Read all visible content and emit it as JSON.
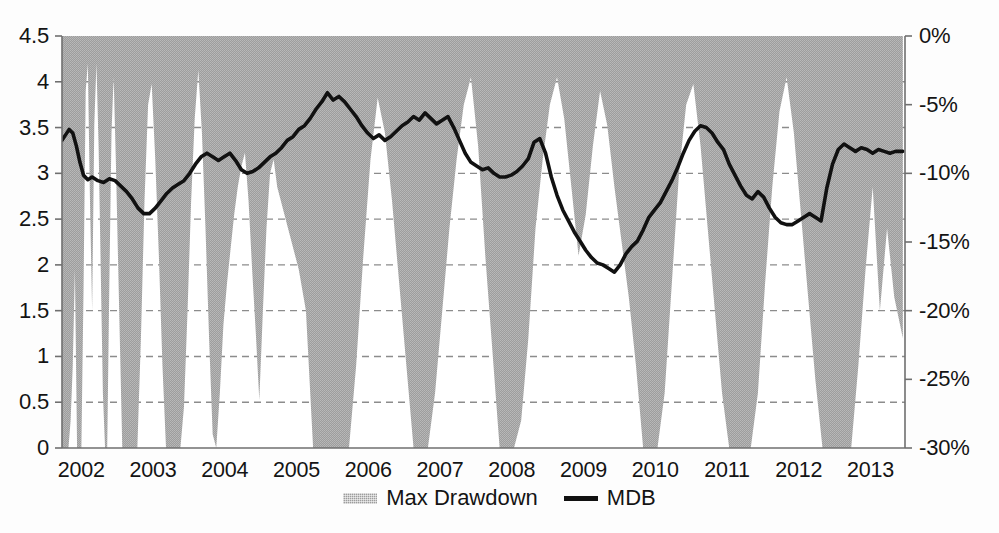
{
  "chart_data": {
    "type": "area",
    "title": "",
    "subtitle": "",
    "xlabel": "",
    "ylabel": "",
    "y2label": "",
    "grid": true,
    "legend_position": "bottom-center",
    "x_range": [
      "2002",
      "2013.75"
    ],
    "x_tick_labels": [
      "2002",
      "2003",
      "2004",
      "2005",
      "2006",
      "2007",
      "2008",
      "2009",
      "2010",
      "2011",
      "2012",
      "2013"
    ],
    "x_tick_values": [
      2002,
      2003,
      2004,
      2005,
      2006,
      2007,
      2008,
      2009,
      2010,
      2011,
      2012,
      2013
    ],
    "y_left_range": [
      0,
      4.5
    ],
    "y_left_tick_labels": [
      "0",
      "0.5",
      "1",
      "1.5",
      "2",
      "2.5",
      "3",
      "3.5",
      "4",
      "4.5"
    ],
    "y_left_tick_values": [
      0,
      0.5,
      1,
      1.5,
      2,
      2.5,
      3,
      3.5,
      4,
      4.5
    ],
    "y_right_range": [
      -30,
      0
    ],
    "y_right_tick_labels": [
      "0%",
      "-5%",
      "-10%",
      "-15%",
      "-20%",
      "-25%",
      "-30%"
    ],
    "y_right_tick_values": [
      0,
      -5,
      -10,
      -15,
      -20,
      -25,
      -30
    ],
    "legend": [
      {
        "name": "Max Drawdown",
        "marker": "area-swatch",
        "color": "#9d9d9d"
      },
      {
        "name": "MDB",
        "marker": "line-swatch",
        "color": "#111111"
      }
    ],
    "series": [
      {
        "name": "MDB",
        "axis": "left",
        "type": "line",
        "color": "#111111",
        "x": [
          2002.0,
          2002.05,
          2002.1,
          2002.15,
          2002.2,
          2002.25,
          2002.3,
          2002.36,
          2002.42,
          2002.5,
          2002.58,
          2002.66,
          2002.74,
          2002.82,
          2002.9,
          2002.98,
          2003.06,
          2003.14,
          2003.22,
          2003.3,
          2003.38,
          2003.46,
          2003.54,
          2003.62,
          2003.7,
          2003.78,
          2003.86,
          2003.94,
          2004.02,
          2004.1,
          2004.18,
          2004.26,
          2004.34,
          2004.42,
          2004.5,
          2004.58,
          2004.66,
          2004.74,
          2004.82,
          2004.9,
          2004.98,
          2005.06,
          2005.14,
          2005.22,
          2005.3,
          2005.38,
          2005.46,
          2005.54,
          2005.62,
          2005.7,
          2005.78,
          2005.86,
          2005.94,
          2006.02,
          2006.1,
          2006.18,
          2006.26,
          2006.34,
          2006.42,
          2006.5,
          2006.58,
          2006.66,
          2006.74,
          2006.82,
          2006.9,
          2006.98,
          2007.06,
          2007.14,
          2007.22,
          2007.3,
          2007.38,
          2007.46,
          2007.54,
          2007.62,
          2007.7,
          2007.78,
          2007.86,
          2007.94,
          2008.02,
          2008.1,
          2008.18,
          2008.26,
          2008.34,
          2008.42,
          2008.5,
          2008.58,
          2008.66,
          2008.74,
          2008.82,
          2008.9,
          2008.98,
          2009.06,
          2009.14,
          2009.22,
          2009.3,
          2009.38,
          2009.46,
          2009.54,
          2009.62,
          2009.7,
          2009.78,
          2009.86,
          2009.94,
          2010.02,
          2010.1,
          2010.18,
          2010.26,
          2010.34,
          2010.42,
          2010.5,
          2010.58,
          2010.66,
          2010.74,
          2010.82,
          2010.9,
          2010.98,
          2011.06,
          2011.14,
          2011.22,
          2011.3,
          2011.38,
          2011.46,
          2011.54,
          2011.62,
          2011.7,
          2011.78,
          2011.86,
          2011.94,
          2012.02,
          2012.1,
          2012.18,
          2012.26,
          2012.34,
          2012.42,
          2012.5,
          2012.58,
          2012.66,
          2012.74,
          2012.82,
          2012.9,
          2012.98,
          2013.06,
          2013.14,
          2013.22,
          2013.3,
          2013.38,
          2013.46,
          2013.54,
          2013.62,
          2013.72
        ],
        "y": [
          3.36,
          3.42,
          3.48,
          3.44,
          3.3,
          3.12,
          2.98,
          2.93,
          2.96,
          2.92,
          2.9,
          2.94,
          2.92,
          2.86,
          2.8,
          2.72,
          2.62,
          2.56,
          2.56,
          2.62,
          2.7,
          2.78,
          2.84,
          2.88,
          2.92,
          3.0,
          3.1,
          3.18,
          3.22,
          3.18,
          3.14,
          3.18,
          3.22,
          3.14,
          3.04,
          3.0,
          3.02,
          3.06,
          3.12,
          3.18,
          3.22,
          3.28,
          3.36,
          3.4,
          3.48,
          3.52,
          3.6,
          3.7,
          3.78,
          3.88,
          3.8,
          3.84,
          3.78,
          3.7,
          3.62,
          3.52,
          3.44,
          3.38,
          3.42,
          3.36,
          3.4,
          3.46,
          3.52,
          3.56,
          3.62,
          3.58,
          3.66,
          3.6,
          3.54,
          3.58,
          3.62,
          3.5,
          3.36,
          3.22,
          3.12,
          3.08,
          3.04,
          3.06,
          3.0,
          2.96,
          2.96,
          2.98,
          3.02,
          3.08,
          3.16,
          3.34,
          3.38,
          3.22,
          2.96,
          2.76,
          2.6,
          2.48,
          2.36,
          2.26,
          2.16,
          2.08,
          2.02,
          2.0,
          1.96,
          1.92,
          2.0,
          2.12,
          2.2,
          2.26,
          2.38,
          2.52,
          2.6,
          2.68,
          2.8,
          2.92,
          3.06,
          3.22,
          3.36,
          3.46,
          3.52,
          3.5,
          3.44,
          3.34,
          3.26,
          3.1,
          2.98,
          2.86,
          2.76,
          2.72,
          2.8,
          2.74,
          2.62,
          2.52,
          2.46,
          2.44,
          2.44,
          2.48,
          2.52,
          2.56,
          2.52,
          2.48,
          2.84,
          3.1,
          3.26,
          3.32,
          3.28,
          3.24,
          3.28,
          3.26,
          3.22,
          3.26,
          3.24,
          3.22,
          3.24,
          3.24
        ]
      },
      {
        "name": "Max Drawdown",
        "axis": "right",
        "type": "area",
        "color": "#9d9d9d",
        "note": "Area hangs down from 0% at the top; values are percent drawdowns (negative).",
        "x": [
          2002.0,
          2002.03,
          2002.06,
          2002.09,
          2002.12,
          2002.15,
          2002.18,
          2002.21,
          2002.24,
          2002.27,
          2002.3,
          2002.33,
          2002.36,
          2002.39,
          2002.42,
          2002.45,
          2002.48,
          2002.51,
          2002.54,
          2002.57,
          2002.6,
          2002.63,
          2002.66,
          2002.69,
          2002.72,
          2002.75,
          2002.78,
          2002.81,
          2002.84,
          2002.87,
          2002.9,
          2002.95,
          2003.0,
          2003.05,
          2003.1,
          2003.15,
          2003.2,
          2003.25,
          2003.3,
          2003.35,
          2003.4,
          2003.45,
          2003.5,
          2003.55,
          2003.6,
          2003.65,
          2003.7,
          2003.75,
          2003.8,
          2003.85,
          2003.9,
          2003.95,
          2004.0,
          2004.05,
          2004.1,
          2004.15,
          2004.2,
          2004.25,
          2004.3,
          2004.35,
          2004.4,
          2004.45,
          2004.5,
          2004.55,
          2004.6,
          2004.65,
          2004.7,
          2004.75,
          2004.8,
          2004.85,
          2004.9,
          2004.95,
          2005.0,
          2005.1,
          2005.2,
          2005.3,
          2005.4,
          2005.5,
          2005.6,
          2005.7,
          2005.8,
          2005.9,
          2006.0,
          2006.1,
          2006.2,
          2006.3,
          2006.4,
          2006.5,
          2006.6,
          2006.7,
          2006.8,
          2006.9,
          2007.0,
          2007.1,
          2007.2,
          2007.3,
          2007.4,
          2007.5,
          2007.6,
          2007.7,
          2007.8,
          2007.9,
          2008.0,
          2008.1,
          2008.2,
          2008.3,
          2008.4,
          2008.5,
          2008.6,
          2008.7,
          2008.8,
          2008.9,
          2009.0,
          2009.1,
          2009.2,
          2009.3,
          2009.4,
          2009.5,
          2009.6,
          2009.7,
          2009.8,
          2009.9,
          2010.0,
          2010.1,
          2010.2,
          2010.3,
          2010.4,
          2010.5,
          2010.6,
          2010.7,
          2010.8,
          2010.9,
          2011.0,
          2011.1,
          2011.2,
          2011.3,
          2011.4,
          2011.5,
          2011.6,
          2011.7,
          2011.8,
          2011.9,
          2012.0,
          2012.1,
          2012.2,
          2012.3,
          2012.4,
          2012.5,
          2012.6,
          2012.7,
          2012.8,
          2012.9,
          2013.0,
          2013.1,
          2013.2,
          2013.3,
          2013.4,
          2013.5,
          2013.6,
          2013.72
        ],
        "y": [
          -30.0,
          -30.0,
          -30.0,
          -30.0,
          -28.0,
          -24.0,
          -17.0,
          -30.0,
          -30.0,
          -30.0,
          -18.5,
          -4.0,
          -2.0,
          -12.0,
          -20.0,
          -6.5,
          -2.0,
          -8.0,
          -17.0,
          -26.0,
          -30.0,
          -30.0,
          -18.0,
          -7.0,
          -3.0,
          -9.0,
          -16.0,
          -23.0,
          -30.0,
          -30.0,
          -30.0,
          -30.0,
          -30.0,
          -30.0,
          -22.0,
          -12.0,
          -5.0,
          -3.5,
          -9.0,
          -16.0,
          -24.0,
          -30.0,
          -30.0,
          -30.0,
          -30.0,
          -30.0,
          -27.0,
          -20.0,
          -12.0,
          -6.0,
          -2.5,
          -7.0,
          -14.0,
          -22.0,
          -29.0,
          -30.0,
          -26.0,
          -21.0,
          -18.0,
          -15.5,
          -13.0,
          -11.0,
          -9.5,
          -8.5,
          -12.0,
          -17.0,
          -21.5,
          -26.5,
          -20.0,
          -14.0,
          -10.0,
          -9.0,
          -11.0,
          -13.0,
          -15.0,
          -17.0,
          -20.0,
          -30.0,
          -30.0,
          -30.0,
          -30.0,
          -30.0,
          -30.0,
          -24.0,
          -16.0,
          -9.0,
          -4.5,
          -7.0,
          -12.0,
          -18.0,
          -24.0,
          -30.0,
          -30.0,
          -30.0,
          -26.0,
          -20.0,
          -14.0,
          -9.0,
          -5.0,
          -3.0,
          -8.0,
          -16.0,
          -23.0,
          -30.0,
          -30.0,
          -30.0,
          -28.0,
          -22.0,
          -14.0,
          -9.0,
          -5.0,
          -3.0,
          -6.0,
          -11.0,
          -16.0,
          -13.0,
          -8.0,
          -4.0,
          -6.5,
          -11.0,
          -15.0,
          -19.0,
          -24.0,
          -30.0,
          -30.0,
          -30.0,
          -26.0,
          -18.0,
          -10.0,
          -5.0,
          -3.5,
          -8.0,
          -14.0,
          -20.0,
          -26.0,
          -30.0,
          -30.0,
          -30.0,
          -30.0,
          -26.0,
          -18.0,
          -11.0,
          -5.5,
          -3.0,
          -7.0,
          -13.0,
          -19.0,
          -25.0,
          -30.0,
          -30.0,
          -30.0,
          -30.0,
          -30.0,
          -24.0,
          -17.0,
          -11.0,
          -20.0,
          -14.0,
          -19.0,
          -22.0
        ]
      }
    ]
  },
  "axes": {
    "left_ticks": [
      "4.5",
      "4",
      "3.5",
      "3",
      "2.5",
      "2",
      "1.5",
      "1",
      "0.5",
      "0"
    ],
    "right_ticks": [
      "0%",
      "-5%",
      "-10%",
      "-15%",
      "-20%",
      "-25%",
      "-30%"
    ],
    "x_ticks": [
      "2002",
      "2003",
      "2004",
      "2005",
      "2006",
      "2007",
      "2008",
      "2009",
      "2010",
      "2011",
      "2012",
      "2013"
    ]
  },
  "legend": {
    "items": [
      {
        "label": "Max Drawdown"
      },
      {
        "label": "MDB"
      }
    ]
  },
  "colors": {
    "area_fill": "#9d9d9d",
    "line": "#111111",
    "grid": "#8c8c8c",
    "axis": "#777777",
    "text": "#141414",
    "background": "#fdfdfd"
  }
}
